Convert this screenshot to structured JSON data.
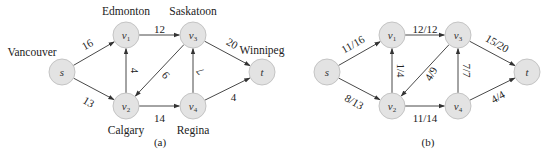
{
  "panels": [
    {
      "id": "a",
      "caption": "(a)",
      "nodes": [
        {
          "id": "s",
          "label": "s",
          "sub": "",
          "city": "Vancouver",
          "x": 62,
          "y": 72
        },
        {
          "id": "v1",
          "label": "v",
          "sub": "1",
          "city": "Edmonton",
          "x": 126,
          "y": 35
        },
        {
          "id": "v3",
          "label": "v",
          "sub": "3",
          "city": "Saskatoon",
          "x": 193,
          "y": 35
        },
        {
          "id": "t",
          "label": "t",
          "sub": "",
          "city": "Winnipeg",
          "x": 262,
          "y": 72
        },
        {
          "id": "v2",
          "label": "v",
          "sub": "2",
          "city": "Calgary",
          "x": 126,
          "y": 106
        },
        {
          "id": "v4",
          "label": "v",
          "sub": "4",
          "city": "Regina",
          "x": 193,
          "y": 106
        }
      ],
      "edges": [
        {
          "from": "s",
          "to": "v1",
          "label": "16"
        },
        {
          "from": "s",
          "to": "v2",
          "label": "13"
        },
        {
          "from": "v1",
          "to": "v3",
          "label": "12"
        },
        {
          "from": "v2",
          "to": "v1",
          "label": "4"
        },
        {
          "from": "v3",
          "to": "v2",
          "label": "9"
        },
        {
          "from": "v2",
          "to": "v4",
          "label": "14"
        },
        {
          "from": "v4",
          "to": "v3",
          "label": "7"
        },
        {
          "from": "v3",
          "to": "t",
          "label": "20"
        },
        {
          "from": "v4",
          "to": "t",
          "label": "4"
        }
      ]
    },
    {
      "id": "b",
      "caption": "(b)",
      "nodes": [
        {
          "id": "s",
          "label": "s",
          "sub": "",
          "x": 327,
          "y": 72
        },
        {
          "id": "v1",
          "label": "v",
          "sub": "1",
          "x": 392,
          "y": 35
        },
        {
          "id": "v3",
          "label": "v",
          "sub": "3",
          "x": 458,
          "y": 35
        },
        {
          "id": "t",
          "label": "t",
          "sub": "",
          "x": 527,
          "y": 72
        },
        {
          "id": "v2",
          "label": "v",
          "sub": "2",
          "x": 392,
          "y": 106
        },
        {
          "id": "v4",
          "label": "v",
          "sub": "4",
          "x": 458,
          "y": 106
        }
      ],
      "edges": [
        {
          "from": "s",
          "to": "v1",
          "label": "11/16"
        },
        {
          "from": "s",
          "to": "v2",
          "label": "8/13"
        },
        {
          "from": "v1",
          "to": "v3",
          "label": "12/12"
        },
        {
          "from": "v2",
          "to": "v1",
          "label": "1/4"
        },
        {
          "from": "v3",
          "to": "v2",
          "label": "4/9"
        },
        {
          "from": "v2",
          "to": "v4",
          "label": "11/14"
        },
        {
          "from": "v4",
          "to": "v3",
          "label": "7/7"
        },
        {
          "from": "v3",
          "to": "t",
          "label": "15/20"
        },
        {
          "from": "v4",
          "to": "t",
          "label": "4/4"
        }
      ]
    }
  ],
  "captions": {
    "a": "(a)",
    "b": "(b)"
  }
}
